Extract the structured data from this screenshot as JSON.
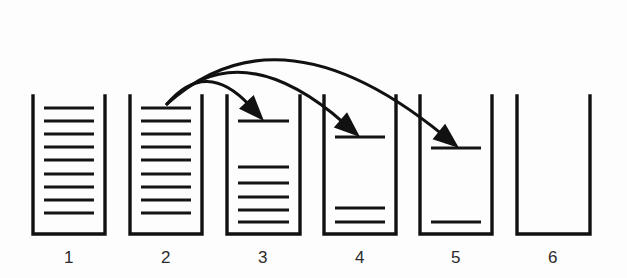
{
  "diagram": {
    "background_color": "#fdfdfd",
    "ink_color": "#111111",
    "width": 627,
    "height": 278,
    "columns": [
      {
        "id": "column-1",
        "label": "1",
        "label_x": 69,
        "label_y": 263,
        "x_left": 33,
        "x_right": 105,
        "y_top": 96,
        "y_bottom": 234,
        "line_count": 9,
        "line_y": [
          108,
          121,
          134,
          147,
          160,
          174,
          187,
          200,
          213
        ],
        "line_inset": 11,
        "has_incoming_arrow": false,
        "has_outgoing_arrow": false
      },
      {
        "id": "column-2",
        "label": "2",
        "label_x": 166,
        "label_y": 263,
        "x_left": 130,
        "x_right": 202,
        "y_top": 96,
        "y_bottom": 234,
        "line_count": 9,
        "line_y": [
          108,
          121,
          134,
          147,
          160,
          174,
          187,
          200,
          213
        ],
        "line_inset": 11,
        "has_incoming_arrow": false,
        "has_outgoing_arrow": true
      },
      {
        "id": "column-3",
        "label": "3",
        "label_x": 263,
        "label_y": 263,
        "x_left": 227,
        "x_right": 300,
        "y_top": 96,
        "y_bottom": 234,
        "line_count": 6,
        "line_y": [
          121,
          167,
          183,
          197,
          210,
          222
        ],
        "line_inset": 11,
        "has_incoming_arrow": true,
        "has_outgoing_arrow": false
      },
      {
        "id": "column-4",
        "label": "4",
        "label_x": 360,
        "label_y": 263,
        "x_left": 324,
        "x_right": 396,
        "y_top": 96,
        "y_bottom": 234,
        "line_count": 3,
        "line_y": [
          137,
          208,
          222
        ],
        "line_inset": 11,
        "has_incoming_arrow": true,
        "has_outgoing_arrow": false
      },
      {
        "id": "column-5",
        "label": "5",
        "label_x": 456,
        "label_y": 263,
        "x_left": 420,
        "x_right": 492,
        "y_top": 96,
        "y_bottom": 234,
        "line_count": 2,
        "line_y": [
          148,
          222
        ],
        "line_inset": 11,
        "has_incoming_arrow": true,
        "has_outgoing_arrow": false
      },
      {
        "id": "column-6",
        "label": "6",
        "label_x": 553,
        "label_y": 263,
        "x_left": 517,
        "x_right": 590,
        "y_top": 96,
        "y_bottom": 234,
        "line_count": 0,
        "line_y": [],
        "line_inset": 11,
        "has_incoming_arrow": false,
        "has_outgoing_arrow": false
      }
    ],
    "arrows": [
      {
        "id": "arrow-2-to-3",
        "from_column": "2",
        "to_column": "3",
        "start_x": 167,
        "start_y": 104,
        "end_x": 264,
        "end_y": 121,
        "control_x": 206,
        "control_y": 58,
        "head_width": 20,
        "head_height": 26
      },
      {
        "id": "arrow-2-to-4",
        "from_column": "2",
        "to_column": "4",
        "start_x": 167,
        "start_y": 104,
        "end_x": 360,
        "end_y": 137,
        "control_x": 240,
        "control_y": 32,
        "head_width": 20,
        "head_height": 26
      },
      {
        "id": "arrow-2-to-5",
        "from_column": "2",
        "to_column": "5",
        "start_x": 167,
        "start_y": 104,
        "end_x": 459,
        "end_y": 148,
        "control_x": 280,
        "control_y": 2,
        "head_width": 20,
        "head_height": 26
      }
    ]
  }
}
